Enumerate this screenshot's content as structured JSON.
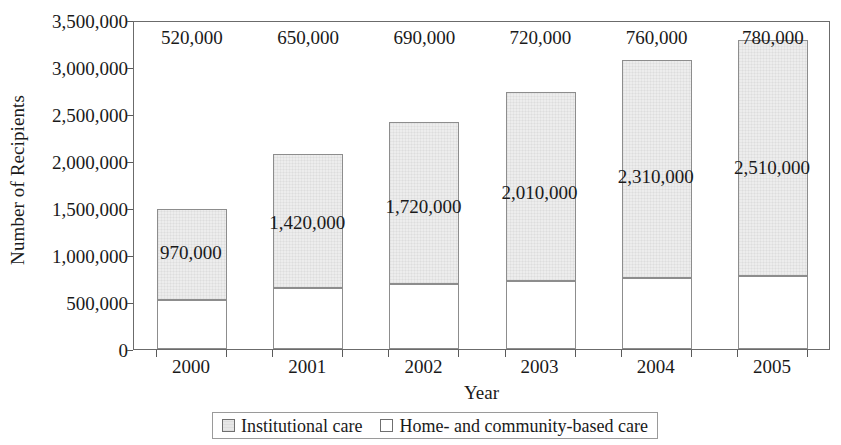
{
  "chart_data": {
    "type": "bar",
    "subtype": "stacked-vertical",
    "title": "",
    "xlabel": "Year",
    "ylabel": "Number of Recipients",
    "categories": [
      "2000",
      "2001",
      "2002",
      "2003",
      "2004",
      "2005"
    ],
    "series": [
      {
        "name": "Home- and community-based care",
        "fill": "#ffffff",
        "values": [
          520000,
          650000,
          690000,
          720000,
          760000,
          780000
        ],
        "labels": [
          "520,000",
          "650,000",
          "690,000",
          "720,000",
          "760,000",
          "780,000"
        ]
      },
      {
        "name": "Institutional care",
        "fill": "#ededed",
        "values": [
          970000,
          1420000,
          1720000,
          2010000,
          2310000,
          2510000
        ],
        "labels": [
          "970,000",
          "1,420,000",
          "1,720,000",
          "2,010,000",
          "2,310,000",
          "2,510,000"
        ]
      }
    ],
    "totals": [
      1490000,
      2070000,
      2410000,
      2730000,
      3070000,
      3290000
    ],
    "ylim": [
      0,
      3500000
    ],
    "ytick_values": [
      0,
      500000,
      1000000,
      1500000,
      2000000,
      2500000,
      3000000,
      3500000
    ],
    "ytick_labels": [
      "0",
      "500,000",
      "1,000,000",
      "1,500,000",
      "2,000,000",
      "2,500,000",
      "3,000,000",
      "3,500,000"
    ],
    "grid": false,
    "legend_position": "bottom",
    "legend_entries": [
      {
        "label": "Institutional care",
        "swatch": "gray"
      },
      {
        "label": "Home- and community-based care",
        "swatch": "white"
      }
    ]
  },
  "axes": {
    "y_title": "Number of Recipients",
    "x_title": "Year"
  },
  "legend": {
    "items": [
      {
        "label": "Institutional care",
        "swatch": "gray"
      },
      {
        "label": "Home- and community-based care",
        "swatch": "white"
      }
    ]
  }
}
